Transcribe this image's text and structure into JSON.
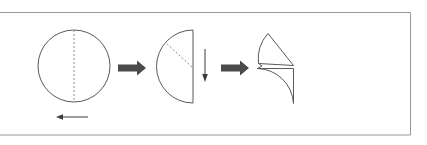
{
  "diagram": {
    "frame": {
      "name": "outer-border",
      "color": "#9a9a9a",
      "x": 0.5,
      "y": 12.5,
      "width": 410,
      "height": 122.5
    },
    "colors": {
      "outline": "#595959",
      "fold_line": "#8a8a8a",
      "arrow_thick": "#4a4a4a",
      "arrow_thin": "#3a3a3a",
      "border": "#9a9a9a",
      "background": "#ffffff"
    },
    "steps": [
      {
        "id": "step-1",
        "label": "circle-with-vertical-fold-line",
        "shape": "circle",
        "center_x": 74,
        "center_y": 66,
        "radius": 36,
        "fold_line": {
          "x1": 74,
          "y1": 30,
          "x2": 74,
          "y2": 102,
          "style": "dashed"
        }
      },
      {
        "id": "step-2",
        "label": "half-circle-with-diagonal-fold-line",
        "shape": "semicircle",
        "flat_edge_x": 193,
        "top_y": 30,
        "bottom_y": 103,
        "bulge_x": 157,
        "fold_line": {
          "x1": 167,
          "y1": 44,
          "x2": 192,
          "y2": 67,
          "style": "dashed"
        }
      },
      {
        "id": "step-3",
        "label": "two-quarter-wedges-opened",
        "shape": "quarter-wedges",
        "pivot_x": 258,
        "pivot_y": 66,
        "upper_tip_x": 294,
        "lower_corner_x": 294,
        "lower_corner_y": 103
      }
    ],
    "arrows": [
      {
        "id": "arrow-1",
        "name": "arrow-right-step1-to-step2",
        "direction": "right",
        "weight": "thick",
        "x1": 118,
        "y1": 68,
        "x2": 146,
        "y2": 68
      },
      {
        "id": "arrow-2",
        "name": "arrow-down-fold",
        "direction": "down",
        "weight": "thin",
        "x1": 205,
        "y1": 49,
        "x2": 205,
        "y2": 82
      },
      {
        "id": "arrow-3",
        "name": "arrow-right-step2-to-step3",
        "direction": "right",
        "weight": "thick",
        "x1": 221,
        "y1": 68,
        "x2": 249,
        "y2": 68
      },
      {
        "id": "arrow-4",
        "name": "arrow-left-fold-direction",
        "direction": "left",
        "weight": "thin",
        "x1": 88,
        "y1": 117,
        "x2": 56,
        "y2": 117
      }
    ]
  }
}
